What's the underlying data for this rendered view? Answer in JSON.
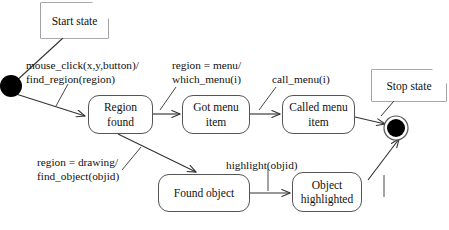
{
  "diagram": {
    "colors": {
      "stroke": "#555555",
      "text": "#111111",
      "fill": "#ffffff",
      "solid": "#000000"
    },
    "notes": [
      {
        "id": "start-note",
        "label": "Start state"
      },
      {
        "id": "stop-note",
        "label": "Stop state"
      }
    ],
    "pseudostates": [
      {
        "id": "initial-state",
        "kind": "initial",
        "label": ""
      },
      {
        "id": "final-state",
        "kind": "final",
        "label": ""
      }
    ],
    "states": [
      {
        "id": "region-found",
        "label": "Region\nfound"
      },
      {
        "id": "got-menu-item",
        "label": "Got menu\nitem"
      },
      {
        "id": "called-menu-item",
        "label": "Called menu\nitem"
      },
      {
        "id": "found-object",
        "label": "Found object"
      },
      {
        "id": "object-highlighted",
        "label": "Object\nhighlighted"
      }
    ],
    "transitions": [
      {
        "id": "t-initial-to-region-found",
        "from": "initial-state",
        "to": "region-found",
        "label": "mouse_click(x,y,button)/\nfind_region(region)"
      },
      {
        "id": "t-region-found-to-got-menu-item",
        "from": "region-found",
        "to": "got-menu-item",
        "label": "region = menu/\nwhich_menu(i)"
      },
      {
        "id": "t-got-menu-item-to-called-menu-item",
        "from": "got-menu-item",
        "to": "called-menu-item",
        "label": "call_menu(i)"
      },
      {
        "id": "t-called-menu-item-to-final",
        "from": "called-menu-item",
        "to": "final-state",
        "label": ""
      },
      {
        "id": "t-region-found-to-found-object",
        "from": "region-found",
        "to": "found-object",
        "label": "region = drawing/\nfind_object(objid)"
      },
      {
        "id": "t-found-object-to-object-highlighted",
        "from": "found-object",
        "to": "object-highlighted",
        "label": "highlight(objid)"
      },
      {
        "id": "t-object-highlighted-to-final",
        "from": "object-highlighted",
        "to": "final-state",
        "label": ""
      }
    ]
  }
}
